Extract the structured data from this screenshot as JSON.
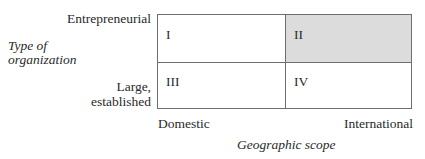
{
  "diagram": {
    "type": "2x2-matrix",
    "y_axis": {
      "title_line1": "Type of",
      "title_line2": "organization",
      "top_label": "Entrepreneurial",
      "bottom_label_line1": "Large,",
      "bottom_label_line2": "established"
    },
    "x_axis": {
      "title": "Geographic scope",
      "left_label": "Domestic",
      "right_label": "International"
    },
    "quadrants": [
      {
        "id": "I",
        "label": "I",
        "position": "top-left",
        "highlighted": false
      },
      {
        "id": "II",
        "label": "II",
        "position": "top-right",
        "highlighted": true
      },
      {
        "id": "III",
        "label": "III",
        "position": "bottom-left",
        "highlighted": false
      },
      {
        "id": "IV",
        "label": "IV",
        "position": "bottom-right",
        "highlighted": false
      }
    ],
    "colors": {
      "highlight_fill": "#dcdcdc",
      "border": "#6e6e6e",
      "text": "#2a2a2a"
    }
  }
}
